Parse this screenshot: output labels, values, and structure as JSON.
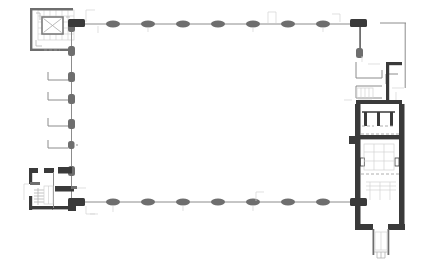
{
  "document": {
    "type": "architectural-floor-plan",
    "title": "",
    "background_color": "#ffffff",
    "width_px": 441,
    "height_px": 273
  },
  "palette": {
    "wall_heavy": "#3a3a3a",
    "wall_mid": "#6e6e6e",
    "wall_light": "#9a9a9a",
    "wall_faint": "#c4c4c4",
    "line_thin": "#8c8c8c",
    "line_ghost": "#d2d2d2",
    "paper": "#ffffff"
  },
  "plan": {
    "description": "Basilica / church ground-floor plan: long rectangular nave bounded north and south by pier colonnades, square tower at north-west corner, entrance porch at south-west corner, chapel buttress stubs along the west wall, and a deep chancel with columned arcade and projecting apse at the east end.",
    "orientation_note": "",
    "nave": {
      "label": "nave",
      "x": 84,
      "y": 20,
      "width": 272,
      "height": 185,
      "interior_fill": "#ffffff"
    },
    "north_colonnade": {
      "label": "north-colonnade",
      "y": 20,
      "pier_count": 9,
      "pier_x": [
        88,
        113,
        140,
        166,
        192,
        218,
        245,
        271,
        297,
        322,
        351
      ],
      "pier_width": 11,
      "pier_height": 6
    },
    "south_colonnade": {
      "label": "south-colonnade",
      "y": 202,
      "pier_count": 9,
      "pier_x": [
        88,
        113,
        140,
        166,
        192,
        218,
        245,
        271,
        297,
        322,
        351
      ],
      "pier_width": 11,
      "pier_height": 6
    },
    "west_wall": {
      "label": "west-wall",
      "x": 70,
      "y_top": 20,
      "y_bottom": 205,
      "pier_y": [
        48,
        76,
        98,
        122,
        145,
        170
      ],
      "chapel_stub_count": 4
    },
    "northwest_tower": {
      "label": "northwest-tower",
      "x": 30,
      "y": 8,
      "width": 45,
      "height": 44,
      "inner_feature": "crossed-square-stair-core"
    },
    "southwest_porch": {
      "label": "southwest-porch",
      "x": 28,
      "y": 168,
      "width": 46,
      "height": 52,
      "inner_feature": "entrance-vestibule-with-stair"
    },
    "east_chancel": {
      "label": "east-chancel",
      "x": 355,
      "y": 100,
      "width": 54,
      "height": 130,
      "arcade_column_count": 3,
      "notes": "columned arcade screen across chancel entry"
    },
    "east_apse": {
      "label": "east-apse",
      "x": 373,
      "y": 228,
      "width": 26,
      "height": 30
    },
    "northeast_annex": {
      "label": "northeast-annex",
      "x": 355,
      "y": 62,
      "width": 50,
      "height": 46,
      "notes": "sacristy / stair block with thin partition walls"
    },
    "outer_boundary": {
      "label": "site-boundary",
      "x": 404,
      "y": 23,
      "notes": "faint setting-out line to the east of the building"
    }
  },
  "annotations": {
    "visible_text": [],
    "scale_bar": "",
    "north_arrow": ""
  }
}
